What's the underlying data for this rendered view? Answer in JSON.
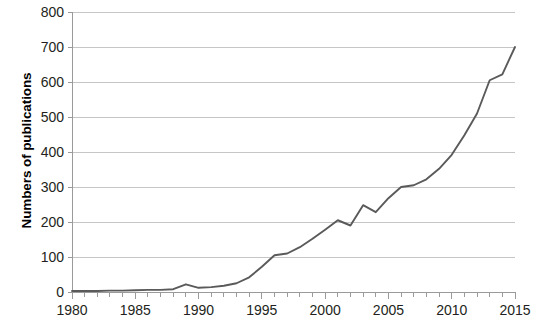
{
  "chart_data": {
    "type": "line",
    "title": "",
    "xlabel": "",
    "ylabel": "Numbers of publications",
    "xlim": [
      1980,
      2015
    ],
    "ylim": [
      0,
      800
    ],
    "grid": true,
    "grid_axis": "y",
    "legend": "none",
    "series_color": "#5a5a5a",
    "yticks": [
      0,
      100,
      200,
      300,
      400,
      500,
      600,
      700,
      800
    ],
    "ytick_labels": [
      "0",
      "100",
      "200",
      "300",
      "400",
      "500",
      "600",
      "700",
      "800"
    ],
    "xticks_major": [
      1980,
      1985,
      1990,
      1995,
      2000,
      2005,
      2010,
      2015
    ],
    "xtick_labels": [
      "1980",
      "1985",
      "1990",
      "1995",
      "2000",
      "2005",
      "2010",
      "2015"
    ],
    "xticks_minor_step": 1,
    "x": [
      1980,
      1981,
      1982,
      1983,
      1984,
      1985,
      1986,
      1987,
      1988,
      1989,
      1990,
      1991,
      1992,
      1993,
      1994,
      1995,
      1996,
      1997,
      1998,
      1999,
      2000,
      2001,
      2002,
      2003,
      2004,
      2005,
      2006,
      2007,
      2008,
      2009,
      2010,
      2011,
      2012,
      2013,
      2014,
      2015
    ],
    "values": [
      3,
      3,
      3,
      4,
      4,
      5,
      6,
      6,
      8,
      22,
      12,
      14,
      18,
      25,
      42,
      72,
      105,
      110,
      128,
      152,
      178,
      205,
      190,
      248,
      228,
      268,
      300,
      305,
      322,
      352,
      392,
      448,
      510,
      605,
      622,
      700
    ],
    "series": [
      {
        "name": "Numbers of publications",
        "color": "#5a5a5a",
        "values": [
          3,
          3,
          3,
          4,
          4,
          5,
          6,
          6,
          8,
          22,
          12,
          14,
          18,
          25,
          42,
          72,
          105,
          110,
          128,
          152,
          178,
          205,
          190,
          248,
          228,
          268,
          300,
          305,
          322,
          352,
          392,
          448,
          510,
          605,
          622,
          700
        ]
      }
    ]
  },
  "axes": {
    "ylabel_text": "Numbers of publications"
  },
  "colors": {
    "line": "#5a5a5a",
    "grid": "#c6c6c6",
    "axis": "#9a9a9a",
    "text": "#231f20"
  }
}
